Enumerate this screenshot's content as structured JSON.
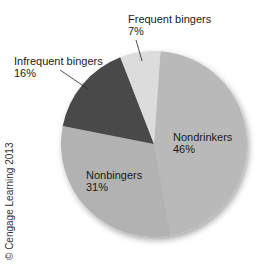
{
  "chart_data": {
    "type": "pie",
    "title": "",
    "categories": [
      "Nondrinkers",
      "Nonbingers",
      "Infrequent bingers",
      "Frequent bingers"
    ],
    "values": [
      46,
      31,
      16,
      7
    ],
    "unit": "%",
    "colors": [
      "#b9b9b9",
      "#b2b2b2",
      "#4a4a4a",
      "#dcdcdc"
    ],
    "start_angle_deg_clockwise_from_top": 4,
    "labels": [
      {
        "name": "Nondrinkers",
        "pct": "46%"
      },
      {
        "name": "Nonbingers",
        "pct": "31%"
      },
      {
        "name": "Infrequent bingers",
        "pct": "16%"
      },
      {
        "name": "Frequent bingers",
        "pct": "7%"
      }
    ],
    "legend": "none (direct labels)"
  },
  "credit": "© Cengage Learning 2013"
}
